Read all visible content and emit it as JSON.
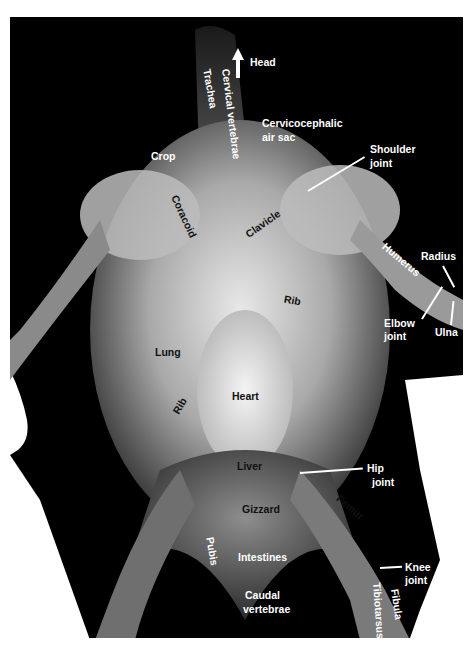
{
  "figure": {
    "orientation_indicator": {
      "icon": "arrow-up-icon",
      "label": "Head"
    },
    "colors": {
      "background": "#000000",
      "paper": "#ffffff",
      "label_light": "#ffffff",
      "label_dark": "#111111"
    },
    "labels": {
      "trachea": "Trachea",
      "cervical_vertebrae": "Cervical vertebrae",
      "cervicocephalic_air_sac_1": "Cervicocephalic",
      "cervicocephalic_air_sac_2": "air sac",
      "crop": "Crop",
      "shoulder_joint_1": "Shoulder",
      "shoulder_joint_2": "joint",
      "coracoid": "Coracoid",
      "clavicle": "Clavicle",
      "humerus": "Humerus",
      "radius": "Radius",
      "rib_upper": "Rib",
      "elbow_joint_1": "Elbow",
      "elbow_joint_2": "joint",
      "ulna": "Ulna",
      "lung": "Lung",
      "rib_lower": "Rib",
      "heart": "Heart",
      "liver": "Liver",
      "hip_joint_1": "Hip",
      "hip_joint_2": "joint",
      "femur": "Femur",
      "gizzard": "Gizzard",
      "pubis": "Pubis",
      "intestines": "Intestines",
      "knee_joint_1": "Knee",
      "knee_joint_2": "joint",
      "caudal_vertebrae_1": "Caudal",
      "caudal_vertebrae_2": "vertebrae",
      "fibula": "Fibula",
      "tibiotarsus": "Tibiotarsus"
    }
  }
}
